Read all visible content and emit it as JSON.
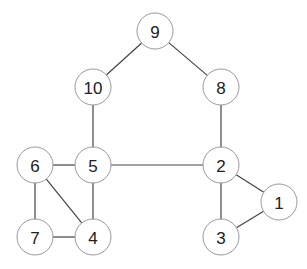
{
  "diagram": {
    "type": "undirected-graph",
    "node_radius": 18,
    "colors": {
      "background": "#ffffff",
      "edge": "#444444",
      "node_stroke": "#999999",
      "node_fill": "#ffffff",
      "label": "#222222"
    },
    "nodes": [
      {
        "id": "9",
        "label": "9",
        "x": 155,
        "y": 31
      },
      {
        "id": "10",
        "label": "10",
        "x": 93,
        "y": 87
      },
      {
        "id": "8",
        "label": "8",
        "x": 221,
        "y": 87
      },
      {
        "id": "6",
        "label": "6",
        "x": 35,
        "y": 165
      },
      {
        "id": "5",
        "label": "5",
        "x": 93,
        "y": 165
      },
      {
        "id": "2",
        "label": "2",
        "x": 221,
        "y": 165
      },
      {
        "id": "1",
        "label": "1",
        "x": 279,
        "y": 202
      },
      {
        "id": "7",
        "label": "7",
        "x": 35,
        "y": 237
      },
      {
        "id": "4",
        "label": "4",
        "x": 93,
        "y": 237
      },
      {
        "id": "3",
        "label": "3",
        "x": 221,
        "y": 237
      }
    ],
    "edges": [
      {
        "from": "9",
        "to": "10"
      },
      {
        "from": "9",
        "to": "8"
      },
      {
        "from": "10",
        "to": "5"
      },
      {
        "from": "8",
        "to": "2"
      },
      {
        "from": "6",
        "to": "5"
      },
      {
        "from": "5",
        "to": "2"
      },
      {
        "from": "6",
        "to": "7"
      },
      {
        "from": "6",
        "to": "4"
      },
      {
        "from": "5",
        "to": "4"
      },
      {
        "from": "7",
        "to": "4"
      },
      {
        "from": "2",
        "to": "3"
      },
      {
        "from": "2",
        "to": "1"
      },
      {
        "from": "3",
        "to": "1"
      }
    ]
  }
}
